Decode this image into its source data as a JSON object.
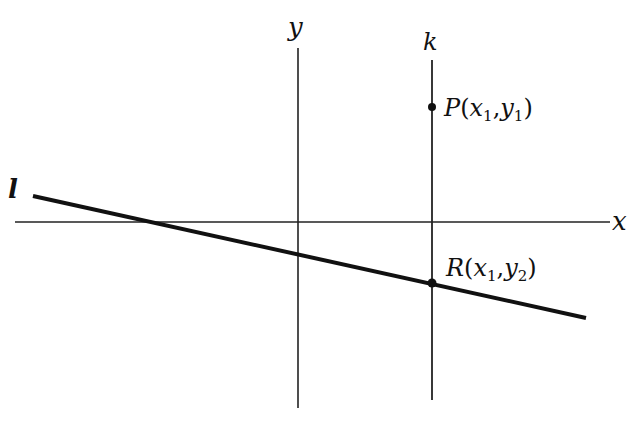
{
  "diagram": {
    "axes": {
      "x_label": "x",
      "y_label": "y"
    },
    "lines": {
      "l_label": "l",
      "k_label": "k"
    },
    "points": {
      "P": {
        "name": "P",
        "open": "(",
        "x": "x",
        "x_sub": "1",
        "comma": ",",
        "y": "y",
        "y_sub": "1",
        "close": ")"
      },
      "R": {
        "name": "R",
        "open": "(",
        "x": "x",
        "x_sub": "1",
        "comma": ",",
        "y": "y",
        "y_sub": "2",
        "close": ")"
      }
    },
    "colors": {
      "ink": "#111111",
      "background": "#ffffff"
    }
  }
}
